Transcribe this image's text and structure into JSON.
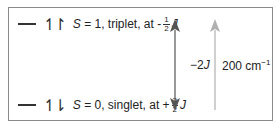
{
  "levels": {
    "triplet": {
      "spin_symbol": "↿↾",
      "variable": "S",
      "text": " = 1, triplet, at -",
      "frac_num": "1",
      "frac_den": "2",
      "unit": "J"
    },
    "singlet": {
      "spin_symbol": "↿⇂",
      "variable": "S",
      "text": " = 0, singlet, at +",
      "frac_num": "3",
      "frac_den": "2",
      "unit": "J"
    }
  },
  "arrows": {
    "exchange": {
      "label_pre": "−2",
      "label_var": "J",
      "color": "#555555",
      "direction": "both"
    },
    "energy": {
      "label_value": "200 cm",
      "label_sup": "−1",
      "color": "#b0b0b0",
      "direction": "up"
    }
  },
  "colors": {
    "frame": "#8a8a8a",
    "text": "#222222"
  }
}
